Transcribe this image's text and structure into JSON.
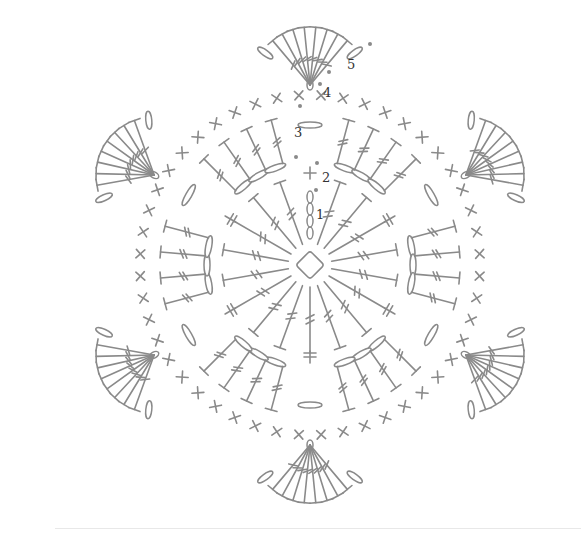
{
  "diagram": {
    "type": "crochet-chart",
    "center": {
      "x": 310,
      "y": 265
    },
    "colors": {
      "stitch": "#8a8a8a",
      "label": "#333333",
      "background": "#ffffff"
    },
    "round_labels": [
      {
        "text": "1",
        "x": 316,
        "y": 219
      },
      {
        "text": "2",
        "x": 322,
        "y": 182
      },
      {
        "text": "3",
        "x": 294,
        "y": 137
      },
      {
        "text": "4",
        "x": 323,
        "y": 97
      },
      {
        "text": "5",
        "x": 347,
        "y": 69
      }
    ],
    "rounds": [
      {
        "round": 1,
        "stitch": "double-crochet",
        "count": 18,
        "inner_r": 22,
        "outer_r": 88
      },
      {
        "round": 2,
        "stitch": "chain-loops",
        "count": 6,
        "r": 95
      },
      {
        "round": 3,
        "stitch": "double-crochet",
        "count": 36,
        "inner_r": 105,
        "outer_r": 150
      },
      {
        "round": 4,
        "stitch": "single-crochet",
        "count": 48,
        "r": 170
      },
      {
        "round": 5,
        "stitch": "double-crochet-fans",
        "petals": 6,
        "fan_stitches": 8,
        "r": 215
      }
    ]
  }
}
